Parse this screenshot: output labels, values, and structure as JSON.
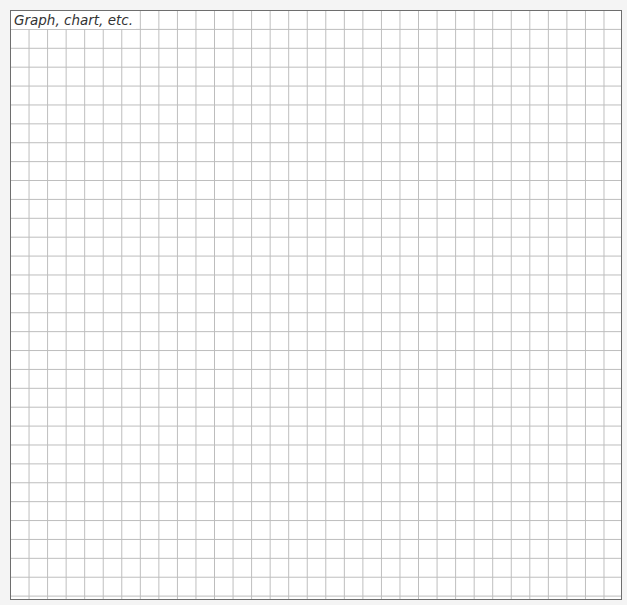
{
  "worksheet": {
    "label": "Graph, chart, etc.",
    "grid": {
      "columns": 33,
      "rows": 31,
      "line_color": "#bdbdbd",
      "border_color": "#6e6e6e"
    }
  }
}
